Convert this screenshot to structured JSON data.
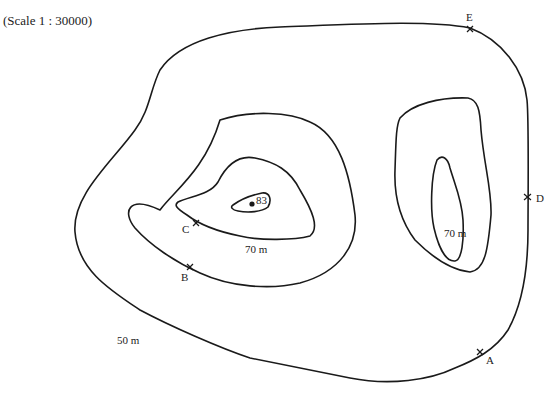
{
  "map": {
    "scale_label": "(Scale 1 : 30000)",
    "contours": [
      {
        "id": "outer",
        "label": "50 m"
      },
      {
        "id": "left-mid",
        "label": "70 m"
      },
      {
        "id": "left-inner",
        "label": ""
      },
      {
        "id": "summit",
        "label": ""
      },
      {
        "id": "right-mid",
        "label": ""
      },
      {
        "id": "right-inner",
        "label": "70 m"
      }
    ],
    "labels": {
      "outer_contour": "50 m",
      "left_contour": "70 m",
      "right_contour": "70 m",
      "summit_height": "83"
    },
    "points": [
      {
        "name": "A",
        "label": "A"
      },
      {
        "name": "B",
        "label": "B"
      },
      {
        "name": "C",
        "label": "C"
      },
      {
        "name": "D",
        "label": "D"
      },
      {
        "name": "E",
        "label": "E"
      }
    ],
    "colors": {
      "line": "#1a1a1a",
      "background": "#ffffff"
    }
  }
}
